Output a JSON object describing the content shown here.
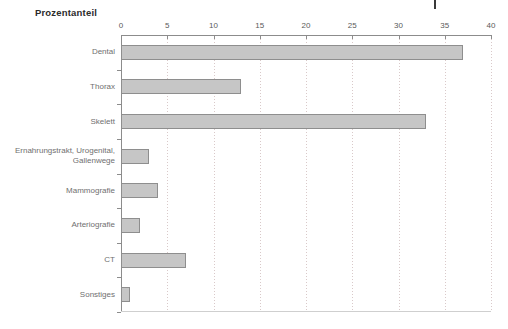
{
  "chart_data": {
    "type": "bar",
    "orientation": "horizontal",
    "title": "Prozentanteil",
    "xlabel": "",
    "ylabel": "",
    "xlim": [
      0,
      40
    ],
    "xticks": [
      0,
      5,
      10,
      15,
      20,
      25,
      30,
      35,
      40
    ],
    "grid": "vertical-dotted",
    "legend": "none",
    "bar_fill_color": "#c6c6c6",
    "bar_border_color": "#8e8e8e",
    "categories": [
      "Dental",
      "Thorax",
      "Skelett",
      "Ernahrungstrakt, Urogenital,\nGallenwege",
      "Mammografie",
      "Arteriografie",
      "CT",
      "Sonstiges"
    ],
    "values": [
      37,
      13,
      33,
      3,
      4,
      2,
      7,
      1
    ]
  },
  "axis": {
    "tick_labels": [
      "0",
      "5",
      "10",
      "15",
      "20",
      "25",
      "30",
      "35",
      "40"
    ]
  }
}
